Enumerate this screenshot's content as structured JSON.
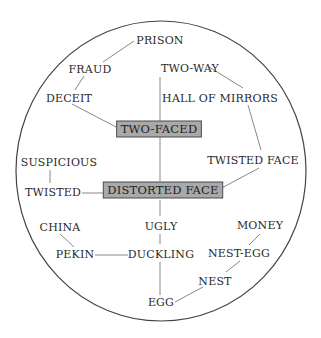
{
  "diagram": {
    "type": "word-association-map",
    "frame": {
      "shape": "ellipse",
      "cx": 161,
      "cy": 171,
      "rx": 145,
      "ry": 150
    },
    "colors": {
      "box_fill": "#a9a9a9",
      "box_border": "#4a4a4a",
      "text": "#2a2a2a",
      "edge": "#7a7a7a",
      "frame": "#444444"
    },
    "nodes": [
      {
        "id": "prison",
        "label": "PRISON",
        "x": 160,
        "y": 44,
        "boxed": false
      },
      {
        "id": "fraud",
        "label": "FRAUD",
        "x": 90,
        "y": 73,
        "boxed": false
      },
      {
        "id": "deceit",
        "label": "DECEIT",
        "x": 69,
        "y": 102,
        "boxed": false
      },
      {
        "id": "two-way",
        "label": "TWO-WAY",
        "x": 190,
        "y": 72,
        "boxed": false
      },
      {
        "id": "hall-of-mirrors",
        "label": "HALL OF MIRRORS",
        "x": 220,
        "y": 102,
        "boxed": false
      },
      {
        "id": "two-faced",
        "label": "TWO-FACED",
        "x": 159,
        "y": 133,
        "boxed": true
      },
      {
        "id": "suspicious",
        "label": "SUSPICIOUS",
        "x": 59,
        "y": 166,
        "boxed": false
      },
      {
        "id": "twisted-face",
        "label": "TWISTED FACE",
        "x": 253,
        "y": 164,
        "boxed": false
      },
      {
        "id": "twisted",
        "label": "TWISTED",
        "x": 53,
        "y": 196,
        "boxed": false
      },
      {
        "id": "distorted-face",
        "label": "DISTORTED FACE",
        "x": 163,
        "y": 194,
        "boxed": true
      },
      {
        "id": "china",
        "label": "CHINA",
        "x": 60,
        "y": 231,
        "boxed": false
      },
      {
        "id": "ugly",
        "label": "UGLY",
        "x": 161,
        "y": 230,
        "boxed": false
      },
      {
        "id": "money",
        "label": "MONEY",
        "x": 260,
        "y": 229,
        "boxed": false
      },
      {
        "id": "pekin",
        "label": "PEKIN",
        "x": 75,
        "y": 258,
        "boxed": false
      },
      {
        "id": "duckling",
        "label": "DUCKLING",
        "x": 161,
        "y": 258,
        "boxed": false
      },
      {
        "id": "nest-egg",
        "label": "NEST-EGG",
        "x": 239,
        "y": 257,
        "boxed": false
      },
      {
        "id": "nest",
        "label": "NEST",
        "x": 215,
        "y": 285,
        "boxed": false
      },
      {
        "id": "egg",
        "label": "EGG",
        "x": 161,
        "y": 306,
        "boxed": false
      }
    ],
    "edges": [
      {
        "from": "prison",
        "to": "fraud",
        "points": [
          [
            134,
            41
          ],
          [
            103,
            62
          ]
        ]
      },
      {
        "from": "fraud",
        "to": "deceit",
        "points": [
          [
            84,
            76
          ],
          [
            75,
            90
          ]
        ]
      },
      {
        "from": "deceit",
        "to": "two-faced",
        "points": [
          [
            72,
            104
          ],
          [
            118,
            128
          ]
        ]
      },
      {
        "from": "two-way",
        "to": "two-faced",
        "points": [
          [
            160,
            77
          ],
          [
            160,
            121
          ]
        ]
      },
      {
        "from": "two-way",
        "to": "hall-of-mirrors",
        "points": [
          [
            209,
            67
          ],
          [
            243,
            88
          ]
        ]
      },
      {
        "from": "hall-of-mirrors",
        "to": "twisted-face",
        "points": [
          [
            248,
            105
          ],
          [
            261,
            150
          ]
        ]
      },
      {
        "from": "two-faced",
        "to": "distorted-face",
        "points": [
          [
            160,
            137
          ],
          [
            160,
            181
          ]
        ]
      },
      {
        "from": "twisted-face",
        "to": "distorted-face",
        "points": [
          [
            259,
            168
          ],
          [
            218,
            190
          ]
        ]
      },
      {
        "from": "suspicious",
        "to": "twisted",
        "points": [
          [
            50,
            170
          ],
          [
            50,
            183
          ]
        ]
      },
      {
        "from": "twisted",
        "to": "distorted-face",
        "points": [
          [
            82,
            193
          ],
          [
            108,
            193
          ]
        ]
      },
      {
        "from": "distorted-face",
        "to": "ugly",
        "points": [
          [
            160,
            200
          ],
          [
            160,
            216
          ]
        ]
      },
      {
        "from": "china",
        "to": "pekin",
        "points": [
          [
            60,
            234
          ],
          [
            74,
            247
          ]
        ]
      },
      {
        "from": "ugly",
        "to": "duckling",
        "points": [
          [
            160,
            234
          ],
          [
            160,
            244
          ]
        ]
      },
      {
        "from": "pekin",
        "to": "duckling",
        "points": [
          [
            95,
            255
          ],
          [
            128,
            255
          ]
        ]
      },
      {
        "from": "duckling",
        "to": "egg",
        "points": [
          [
            160,
            262
          ],
          [
            160,
            295
          ]
        ]
      },
      {
        "from": "money",
        "to": "nest-egg",
        "points": [
          [
            260,
            234
          ],
          [
            249,
            245
          ]
        ]
      },
      {
        "from": "nest-egg",
        "to": "nest",
        "points": [
          [
            240,
            261
          ],
          [
            226,
            272
          ]
        ]
      },
      {
        "from": "nest",
        "to": "egg",
        "points": [
          [
            203,
            287
          ],
          [
            175,
            302
          ]
        ]
      }
    ]
  }
}
